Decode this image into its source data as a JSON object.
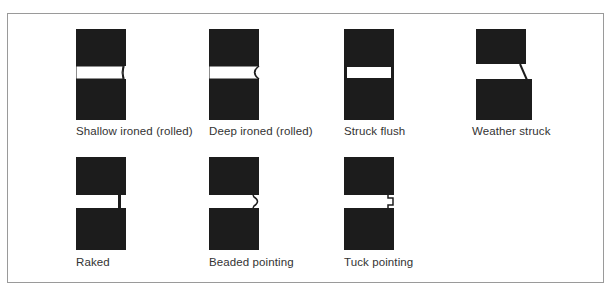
{
  "figure": {
    "colors": {
      "brick": "#1c1c1c",
      "mortar": "#ffffff",
      "frame": "#9a9a9a",
      "text": "#333333"
    },
    "joints": [
      {
        "id": "shallow-ironed",
        "label": "Shallow ironed (rolled)",
        "profile": "shallow-concave"
      },
      {
        "id": "deep-ironed",
        "label": "Deep ironed (rolled)",
        "profile": "deep-concave"
      },
      {
        "id": "struck-flush",
        "label": "Struck flush",
        "profile": "flush"
      },
      {
        "id": "weather-struck",
        "label": "Weather struck",
        "profile": "sloped"
      },
      {
        "id": "raked",
        "label": "Raked",
        "profile": "recessed"
      },
      {
        "id": "beaded-pointing",
        "label": "Beaded pointing",
        "profile": "bead"
      },
      {
        "id": "tuck-pointing",
        "label": "Tuck pointing",
        "profile": "tuck"
      }
    ]
  }
}
